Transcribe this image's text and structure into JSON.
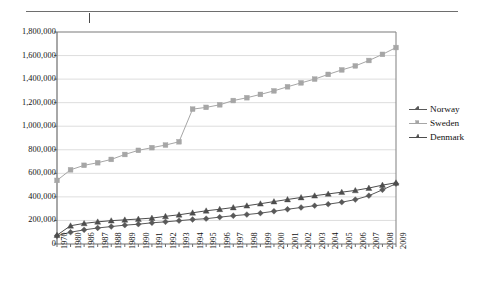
{
  "page": {
    "top_rule": "horizontal-rule",
    "background": "#ffffff"
  },
  "chart_data": {
    "type": "line",
    "title": "",
    "subtitle": "",
    "xlabel": "",
    "ylabel": "",
    "grid": true,
    "gridlines": "horizontal",
    "legend_position": "right",
    "ylim": [
      0,
      1800000
    ],
    "ytick_step": 200000,
    "ytick_labels": [
      "1,800,000",
      "1,600,000",
      "1,400,000",
      "1,200,000",
      "1,000,000",
      "800,000",
      "600,000",
      "400,000",
      "200,000",
      "0"
    ],
    "ytick_values": [
      1800000,
      1600000,
      1400000,
      1200000,
      1000000,
      800000,
      600000,
      400000,
      200000,
      0
    ],
    "categories": [
      "1970",
      "1980",
      "1986",
      "1987",
      "1988",
      "1989",
      "1990",
      "1991",
      "1992",
      "1993",
      "1994",
      "1995",
      "1996",
      "1997",
      "1998",
      "1999",
      "2000",
      "2001",
      "2002",
      "2003",
      "2004",
      "2005",
      "2006",
      "2007",
      "2008",
      "2009"
    ],
    "series": [
      {
        "name": "Norway",
        "color": "#595959",
        "marker": "diamond",
        "values": [
          70000,
          100000,
          120000,
          136000,
          148000,
          160000,
          168000,
          180000,
          188000,
          198000,
          208000,
          215000,
          228000,
          240000,
          250000,
          262000,
          278000,
          295000,
          310000,
          325000,
          338000,
          355000,
          377000,
          410000,
          460000,
          512000
        ]
      },
      {
        "name": "Sweden",
        "color": "#a6a6a6",
        "marker": "square",
        "values": [
          540000,
          630000,
          668000,
          690000,
          718000,
          760000,
          795000,
          818000,
          840000,
          868000,
          1145000,
          1160000,
          1182000,
          1218000,
          1242000,
          1270000,
          1300000,
          1335000,
          1368000,
          1400000,
          1440000,
          1478000,
          1512000,
          1558000,
          1610000,
          1668000
        ]
      },
      {
        "name": "Denmark",
        "color": "#4d4d4d",
        "marker": "triangle",
        "values": [
          75000,
          155000,
          175000,
          188000,
          198000,
          205000,
          212000,
          220000,
          235000,
          248000,
          265000,
          282000,
          295000,
          310000,
          325000,
          342000,
          360000,
          378000,
          395000,
          410000,
          425000,
          440000,
          455000,
          475000,
          500000,
          520000
        ]
      }
    ]
  },
  "legend": {
    "items": [
      {
        "label": "Norway",
        "color": "#595959",
        "marker": "diamond"
      },
      {
        "label": "Sweden",
        "color": "#a6a6a6",
        "marker": "square"
      },
      {
        "label": "Denmark",
        "color": "#4d4d4d",
        "marker": "triangle"
      }
    ]
  }
}
